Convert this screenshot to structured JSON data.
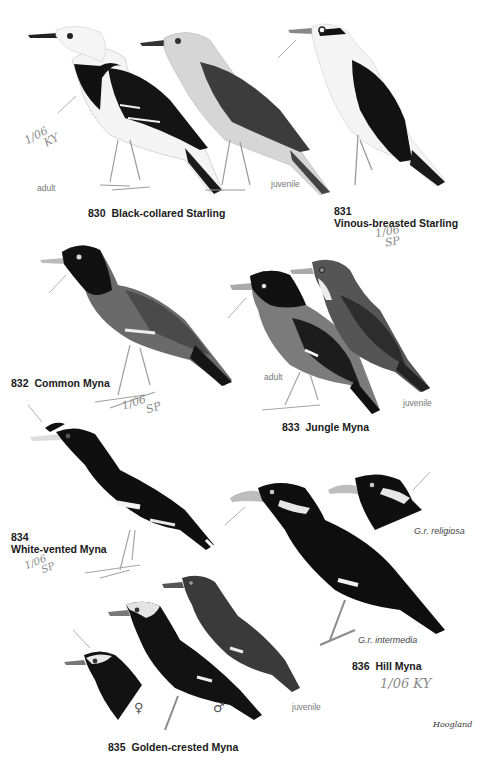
{
  "plate": {
    "species": [
      {
        "number": "830",
        "name": "Black-collared Starling",
        "ages": [
          "adult",
          "juvenile"
        ],
        "annotation": [
          "1/06",
          "KY"
        ]
      },
      {
        "number": "831",
        "name": "Vinous-breasted Starling",
        "annotation": [
          "1/06",
          "SP"
        ]
      },
      {
        "number": "832",
        "name": "Common Myna",
        "annotation": [
          "1/06",
          "SP"
        ]
      },
      {
        "number": "833",
        "name": "Jungle Myna",
        "ages": [
          "adult",
          "juvenile"
        ]
      },
      {
        "number": "834",
        "name": "White-vented Myna",
        "annotation": [
          "1/06",
          "SP"
        ]
      },
      {
        "number": "835",
        "name": "Golden-crested Myna",
        "sexes": [
          "♀",
          "♂"
        ],
        "ages": [
          "juvenile"
        ]
      },
      {
        "number": "836",
        "name": "Hill Myna",
        "subspecies": [
          "G.r. religiosa",
          "G.r. intermedia"
        ],
        "annotation": [
          "1/06 KY"
        ]
      }
    ],
    "signature": "Hoogland"
  },
  "colors": {
    "black_plumage": "#111111",
    "gray_plumage": "#6e6e6e",
    "light_gray": "#c8c8c8",
    "pale": "#f2f2f2",
    "text": "#1a1a1a",
    "pencil": "#8a8a8a"
  }
}
